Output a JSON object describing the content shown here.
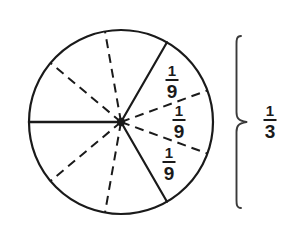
{
  "figure": {
    "type": "fraction-circle-diagram",
    "background_color": "#ffffff",
    "stroke_color": "#1a1a1a",
    "circle": {
      "center_x": 121,
      "center_y": 122,
      "radius": 92,
      "total_sectors": 9,
      "sector_angle_degrees": 40
    },
    "sector_labels": [
      {
        "numerator": "1",
        "denominator": "9",
        "x": 172,
        "y": 82
      },
      {
        "numerator": "1",
        "denominator": "9",
        "x": 179,
        "y": 122
      },
      {
        "numerator": "1",
        "denominator": "9",
        "x": 169,
        "y": 164
      }
    ],
    "brace_label": {
      "numerator": "1",
      "denominator": "3",
      "x": 270,
      "y": 122
    },
    "brace": {
      "x": 236,
      "top_y": 36,
      "bottom_y": 208,
      "tip_x": 247,
      "mid_y": 122
    },
    "radii": [
      {
        "angle_degrees": 180,
        "style": "solid",
        "name": "radius-left-horizontal"
      },
      {
        "angle_degrees": 140,
        "style": "dashed",
        "name": "radius-upper-left-outer"
      },
      {
        "angle_degrees": 100,
        "style": "dashed",
        "name": "radius-upper-left-inner"
      },
      {
        "angle_degrees": 60,
        "style": "solid",
        "name": "radius-upper-right-boundary"
      },
      {
        "angle_degrees": 20,
        "style": "dashed",
        "name": "radius-right-upper-divider"
      },
      {
        "angle_degrees": 340,
        "style": "dashed",
        "name": "radius-right-lower-divider"
      },
      {
        "angle_degrees": 300,
        "style": "solid",
        "name": "radius-lower-right-boundary"
      },
      {
        "angle_degrees": 260,
        "style": "dashed",
        "name": "radius-lower-left-inner"
      },
      {
        "angle_degrees": 220,
        "style": "dashed",
        "name": "radius-lower-left-outer"
      }
    ]
  }
}
